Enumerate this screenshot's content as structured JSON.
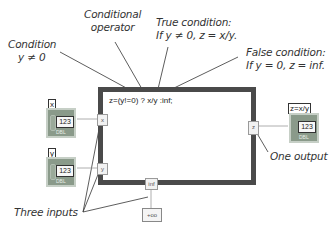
{
  "annotations": {
    "condition": {
      "line1": "Condition",
      "line2": "y ≠ 0"
    },
    "conditional_operator": {
      "line1": "Conditional",
      "line2": "operator"
    },
    "true_condition": {
      "line1": "True condition:",
      "line2": "If y ≠ 0, z = x/y."
    },
    "false_condition": {
      "line1": "False condition:",
      "line2": "If y = 0, z = inf."
    },
    "one_output": "One output",
    "three_inputs": "Three inputs"
  },
  "formula_node": {
    "expression": "z=(y!=0) ? x/y :inf;",
    "input_tunnels": [
      "x",
      "y",
      "inf"
    ],
    "output_tunnel": "z"
  },
  "controls": [
    {
      "label": "x",
      "display": "123",
      "type": "DBL"
    },
    {
      "label": "y",
      "display": "123",
      "type": "DBL"
    }
  ],
  "indicator": {
    "label": "z=x/y",
    "display": "123",
    "type": "DBL"
  },
  "constant": {
    "value": "+oo"
  },
  "colors": {
    "structure_border": "#4a4a4a",
    "terminal_fill": "#8a9a8a",
    "text": "#333333"
  }
}
